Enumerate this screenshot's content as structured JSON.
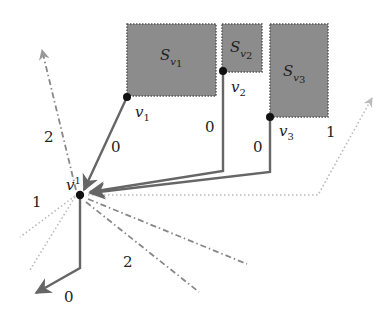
{
  "diagram": {
    "vertex_center": {
      "label": "v",
      "superscript": "1"
    },
    "regions": [
      {
        "id": "S_v1",
        "base": "S",
        "sub": "v",
        "subsub": "1"
      },
      {
        "id": "S_v2",
        "base": "S",
        "sub": "v",
        "subsub": "2"
      },
      {
        "id": "S_v3",
        "base": "S",
        "sub": "v",
        "subsub": "3"
      }
    ],
    "vertices": [
      {
        "id": "v1",
        "base": "v",
        "sub": "1"
      },
      {
        "id": "v2",
        "base": "v",
        "sub": "2"
      },
      {
        "id": "v3",
        "base": "v",
        "sub": "3"
      }
    ],
    "edge_labels": {
      "v1_edge": "0",
      "v2_edge": "0",
      "v3_edge": "0",
      "dashdot_up": "2",
      "dotted_right": "1",
      "dotted_left": "1",
      "dashdot_down": "2",
      "solid_down": "0"
    },
    "colors": {
      "region_fill": "#8c8c8c",
      "solid_edge": "#666666",
      "dashed_edge": "#888888",
      "dotted_edge": "#bbbbbb",
      "vertex": "#111111"
    }
  }
}
